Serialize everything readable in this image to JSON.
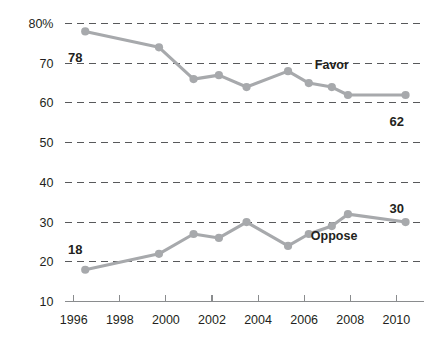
{
  "chart_data": {
    "type": "line",
    "title": "",
    "subtitle": "",
    "xlabel": "",
    "ylabel": "",
    "xlim": [
      1995.6,
      2011.2
    ],
    "ylim": [
      10,
      80
    ],
    "grid": true,
    "grid_axis": "y",
    "legend_position": "inline-annotation",
    "x_ticks": [
      1996,
      1998,
      2000,
      2002,
      2004,
      2006,
      2008,
      2010
    ],
    "x_tick_labels": [
      "1996",
      "1998",
      "2000",
      "2002",
      "2004",
      "2006",
      "2008",
      "2010"
    ],
    "y_ticks": [
      10,
      20,
      30,
      40,
      50,
      60,
      70,
      80
    ],
    "y_tick_labels": [
      "10",
      "20",
      "30",
      "40",
      "50",
      "60",
      "70",
      "80%"
    ],
    "series": [
      {
        "name": "Favor",
        "color": "#a7a9ac",
        "label_x": 2007.2,
        "label_y": 68.5,
        "start_value_label": "78",
        "end_value_label": "62",
        "x": [
          1996.5,
          1999.7,
          2001.2,
          2002.3,
          2003.5,
          2005.3,
          2006.2,
          2007.2,
          2007.9,
          2010.4
        ],
        "values": [
          78,
          74,
          66,
          67,
          64,
          68,
          65,
          64,
          62,
          62
        ]
      },
      {
        "name": "Oppose",
        "color": "#a7a9ac",
        "label_x": 2007.3,
        "label_y": 25.5,
        "start_value_label": "18",
        "end_value_label": "30",
        "x": [
          1996.5,
          1999.7,
          2001.2,
          2002.3,
          2003.5,
          2005.3,
          2006.2,
          2007.2,
          2007.9,
          2010.4
        ],
        "values": [
          18,
          22,
          27,
          26,
          30,
          24,
          27,
          29,
          32,
          30
        ]
      }
    ]
  },
  "annotations": {
    "favor_start": "78",
    "favor_end": "62",
    "oppose_start": "18",
    "oppose_end": "30",
    "favor_name": "Favor",
    "oppose_name": "Oppose"
  },
  "colors": {
    "line": "#a7a9ac",
    "grid": "#58595b",
    "axis": "#8a8c8e",
    "text": "#231f20",
    "background": "#ffffff"
  }
}
